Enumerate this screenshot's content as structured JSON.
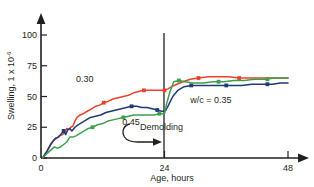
{
  "chart_data": {
    "type": "line",
    "title": "",
    "subtitle": "",
    "xlabel": "Age, hours",
    "ylabel": "Swelling, 1 x 10",
    "ylabel_exponent": "-6",
    "xlim": [
      0,
      50
    ],
    "ylim": [
      0,
      110
    ],
    "xticks": [
      0,
      24,
      48
    ],
    "xtick_labels": [
      "0",
      "24",
      "48"
    ],
    "yticks": [
      0,
      25,
      50,
      75,
      100
    ],
    "ytick_labels": [
      "0",
      "25",
      "50",
      "75",
      "100"
    ],
    "grid": false,
    "legend_position": "inline-labels",
    "annotations": [
      {
        "name": "demolding",
        "text": "Demolding",
        "x": 24,
        "note": "vertical line at 24 hours with curved arrow pointing to it"
      }
    ],
    "series": [
      {
        "name": "w/c 0.30",
        "label": "0.30",
        "color": "#e8432a",
        "label_x": 8.5,
        "label_y": 62,
        "x": [
          0.3,
          1.0,
          1.8,
          2.4,
          3.0,
          3.6,
          4.2,
          4.6,
          5.0,
          5.4,
          5.8,
          6.2,
          6.6,
          7.0,
          7.6,
          8.2,
          9.0,
          9.8,
          10.6,
          11.4,
          12.2,
          13.0,
          14.0,
          15.0,
          16.0,
          17.0,
          18.0,
          19.0,
          20.0,
          21.0,
          22.0,
          23.0,
          23.9,
          24.0,
          24.6,
          25.4,
          26.4,
          27.6,
          29.0,
          30.6,
          32.5,
          34.5,
          36.5,
          38.5,
          41.0,
          43.5,
          46.0,
          48.0
        ],
        "y": [
          0,
          4,
          10,
          14,
          16,
          18,
          19,
          21,
          24,
          23,
          25,
          26,
          30,
          33,
          35,
          36,
          38,
          40,
          42,
          43,
          45,
          46,
          48,
          49,
          50,
          51,
          53,
          54,
          55,
          55,
          55,
          55,
          55,
          55,
          56,
          58,
          60,
          62,
          64,
          65,
          66,
          66,
          66,
          65,
          65,
          65,
          65,
          65
        ],
        "markers_x": [
          12.2,
          20.0,
          24.0,
          30.6,
          38.5
        ],
        "markers_y": [
          45,
          55,
          55,
          65,
          65
        ]
      },
      {
        "name": "w/c 0.35",
        "label": "w/c =  0.35",
        "color": "#1f3a78",
        "label_x": 33,
        "label_y": 45,
        "x": [
          0.3,
          1.2,
          2.0,
          2.8,
          3.4,
          4.0,
          4.4,
          4.8,
          5.2,
          5.6,
          6.0,
          6.6,
          7.2,
          8.0,
          8.8,
          9.6,
          10.6,
          11.6,
          12.6,
          13.6,
          14.6,
          15.6,
          16.6,
          17.6,
          18.6,
          19.6,
          20.6,
          21.6,
          22.6,
          23.4,
          23.9,
          24.3,
          24.9,
          25.6,
          26.6,
          27.8,
          29.2,
          31.0,
          33.0,
          35.0,
          37.0,
          39.0,
          41.0,
          43.0,
          45.0,
          46.5,
          48.0
        ],
        "y": [
          0,
          6,
          12,
          16,
          17,
          20,
          22,
          19,
          23,
          24,
          22,
          25,
          27,
          29,
          31,
          33,
          34,
          35,
          37,
          38,
          39,
          40,
          41,
          42,
          42,
          41,
          41,
          40,
          39,
          38,
          38,
          39,
          44,
          50,
          55,
          58,
          59,
          59,
          59,
          59,
          59,
          59,
          60,
          60,
          60,
          61,
          61
        ],
        "markers_x": [
          4.4,
          17.6,
          22.6,
          29.2,
          36.0,
          44.0
        ],
        "markers_y": [
          22,
          42,
          39,
          59,
          59,
          60
        ]
      },
      {
        "name": "w/c 0.45",
        "label": "0.45",
        "color": "#3f9e4d",
        "label_x": 17.5,
        "label_y": 27,
        "x": [
          0.3,
          1.0,
          1.8,
          2.6,
          3.2,
          3.8,
          4.4,
          5.0,
          5.6,
          6.2,
          6.8,
          7.6,
          8.4,
          9.2,
          10.0,
          11.0,
          12.0,
          13.0,
          14.0,
          15.0,
          16.0,
          17.0,
          18.0,
          19.0,
          20.0,
          21.0,
          22.0,
          23.0,
          23.8,
          24.0,
          24.4,
          25.0,
          25.8,
          26.8,
          28.0,
          29.5,
          31.5,
          33.5,
          35.5,
          37.5,
          39.5,
          41.5,
          43.5,
          45.5,
          47.0,
          48.0
        ],
        "y": [
          0,
          3,
          6,
          9,
          8,
          9,
          11,
          13,
          17,
          17,
          18,
          20,
          22,
          24,
          25,
          27,
          28,
          30,
          31,
          32,
          33,
          34,
          35,
          35,
          35,
          35,
          35,
          36,
          36,
          36,
          44,
          53,
          62,
          63,
          62,
          61,
          61,
          62,
          62,
          63,
          63,
          64,
          64,
          65,
          65,
          65
        ],
        "markers_x": [
          10.0,
          16.0,
          23.0,
          26.8,
          34.5,
          44.0
        ],
        "markers_y": [
          25,
          33,
          36,
          63,
          62,
          64
        ]
      }
    ]
  }
}
